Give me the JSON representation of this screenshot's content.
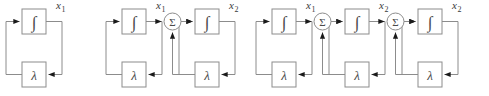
{
  "figure": {
    "type": "block-diagram",
    "colors": {
      "background": "#ffffff",
      "box_stroke": "#8c8c8c",
      "wire": "#8c8c8c",
      "glyph": "#4a4a4a",
      "label": "#3a3a3a",
      "arrowhead": "#1a1a1a"
    },
    "glyphs": {
      "integrator": "∫",
      "gain": "λ",
      "summer": "Σ"
    },
    "diagrams": [
      {
        "id": "diagram-1",
        "stage_count": 1,
        "stages": [
          {
            "integrator_label": "∫",
            "gain_label": "λ",
            "output_label": "x",
            "output_subscript": "1",
            "has_summer": false
          }
        ]
      },
      {
        "id": "diagram-2",
        "stage_count": 2,
        "stages": [
          {
            "integrator_label": "∫",
            "gain_label": "λ",
            "output_label": "x",
            "output_subscript": "1",
            "has_summer": false
          },
          {
            "integrator_label": "∫",
            "gain_label": "λ",
            "output_label": "x",
            "output_subscript": "2",
            "has_summer": true,
            "summer_label": "Σ"
          }
        ]
      },
      {
        "id": "diagram-3",
        "stage_count": 3,
        "stages": [
          {
            "integrator_label": "∫",
            "gain_label": "λ",
            "output_label": "x",
            "output_subscript": "1",
            "has_summer": false
          },
          {
            "integrator_label": "∫",
            "gain_label": "λ",
            "output_label": "x",
            "output_subscript": "2",
            "has_summer": true,
            "summer_label": "Σ"
          },
          {
            "integrator_label": "∫",
            "gain_label": "λ",
            "output_label": "x",
            "output_subscript": "2",
            "has_summer": true,
            "summer_label": "Σ"
          }
        ]
      }
    ]
  }
}
